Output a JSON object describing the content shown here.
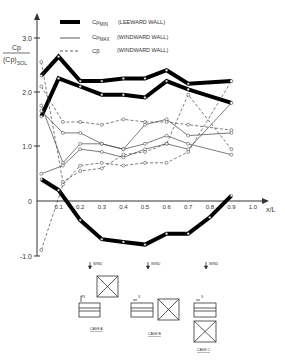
{
  "chart_data": {
    "type": "line",
    "title": "",
    "ylabel": "Cp / (Cp)SOL",
    "xlabel": "x/L",
    "xlim": [
      0,
      1.0
    ],
    "ylim": [
      -1.0,
      3.0
    ],
    "x_ticks": [
      "0.1",
      "0.2",
      "0.3",
      "0.4",
      "0.5",
      "0.6",
      "0.7",
      "0.8",
      "0.9",
      "1.0"
    ],
    "y_ticks": [
      "3.0",
      "2.0",
      "1.0",
      "0",
      "-1.0"
    ],
    "legend": [
      {
        "label": "Cp MIN (LEEWARD WALL)",
        "style": "thick"
      },
      {
        "label": "Cp MAX (WINDWARD WALL)",
        "style": "thin"
      },
      {
        "label": "Cβ (WINDWARD WALL)",
        "style": "dashed"
      }
    ],
    "series": [
      {
        "name": "Cp MIN case A",
        "style": "thick",
        "x": [
          0.02,
          0.1,
          0.2,
          0.3,
          0.4,
          0.5,
          0.6,
          0.7,
          0.9
        ],
        "values": [
          2.3,
          2.65,
          2.2,
          2.2,
          2.25,
          2.25,
          2.4,
          2.15,
          2.2
        ]
      },
      {
        "name": "Cp MIN case B",
        "style": "thick",
        "x": [
          0.02,
          0.1,
          0.2,
          0.3,
          0.4,
          0.5,
          0.6,
          0.7,
          0.9
        ],
        "values": [
          1.55,
          2.25,
          2.1,
          1.95,
          1.95,
          1.9,
          2.2,
          2.05,
          1.8
        ]
      },
      {
        "name": "Cp MIN case C",
        "style": "thick",
        "x": [
          0.02,
          0.1,
          0.2,
          0.3,
          0.4,
          0.5,
          0.6,
          0.7,
          0.8,
          0.9
        ],
        "values": [
          0.4,
          0.2,
          -0.35,
          -0.7,
          -0.75,
          -0.8,
          -0.6,
          -0.6,
          -0.3,
          0.1
        ]
      },
      {
        "name": "Cp MAX case C",
        "style": "thin",
        "x": [
          0.02,
          0.12,
          0.2,
          0.3,
          0.4,
          0.5,
          0.6,
          0.7,
          0.9
        ],
        "values": [
          1.65,
          1.25,
          1.25,
          1.05,
          0.95,
          1.05,
          1.2,
          1.05,
          0.85
        ]
      },
      {
        "name": "Cp MAX case A",
        "style": "thin",
        "x": [
          0.02,
          0.12,
          0.2,
          0.3,
          0.4,
          0.5,
          0.6,
          0.7,
          0.9
        ],
        "values": [
          1.75,
          0.7,
          1.05,
          1.05,
          0.95,
          1.4,
          1.5,
          1.2,
          1.25
        ]
      },
      {
        "name": "Cp MAX case B",
        "style": "thin",
        "x": [
          0.02,
          0.12,
          0.2,
          0.3,
          0.4,
          0.5,
          0.6,
          0.7,
          0.9
        ],
        "values": [
          0.5,
          0.65,
          0.95,
          0.9,
          0.8,
          0.95,
          1.05,
          0.95,
          1.8
        ]
      },
      {
        "name": "Cβ case C",
        "style": "dashed",
        "x": [
          0.02,
          0.12,
          0.2,
          0.3,
          0.4,
          0.5,
          0.6,
          0.7,
          0.9
        ],
        "values": [
          2.1,
          1.45,
          1.45,
          1.4,
          1.5,
          1.45,
          1.45,
          1.4,
          1.3
        ]
      },
      {
        "name": "Cβ case A",
        "style": "dashed",
        "x": [
          0.02,
          0.12,
          0.2,
          0.3,
          0.4,
          0.5,
          0.6,
          0.7,
          0.9
        ],
        "values": [
          2.55,
          0.35,
          0.55,
          0.6,
          0.85,
          0.9,
          1.05,
          1.95,
          0.95
        ]
      },
      {
        "name": "Cβ case B",
        "style": "dashed",
        "x": [
          0.02,
          0.12,
          0.2,
          0.3,
          0.4,
          0.5,
          0.6,
          0.7,
          0.9
        ],
        "values": [
          -0.9,
          0.3,
          0.65,
          0.7,
          0.65,
          0.7,
          0.7,
          0.9,
          2.2
        ]
      }
    ]
  },
  "legend_labels": {
    "cpmin": "(LEEWARD WALL)",
    "cpmax": "(WINDWARD WALL)",
    "cbeta": "(WINDWARD WALL)"
  },
  "diagrams": [
    {
      "label": "CASE A",
      "wind": "WIND",
      "x_marker": "X"
    },
    {
      "label": "CASE B",
      "wind": "WIND",
      "x_marker": "X"
    },
    {
      "label": "CASE C",
      "wind": "WIND",
      "x_marker": "X"
    }
  ]
}
